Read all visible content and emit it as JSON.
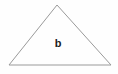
{
  "figure": {
    "type": "geometry-diagram",
    "shape_name": "triangle",
    "background_color": "#fefefe",
    "stroke_color": "#9a9a9a",
    "stroke_width": 1,
    "canvas": {
      "width": 118,
      "height": 74
    },
    "vertices": [
      {
        "name": "apex",
        "x": 57,
        "y": 5
      },
      {
        "name": "bottom-right",
        "x": 111,
        "y": 65
      },
      {
        "name": "bottom-left",
        "x": 9,
        "y": 65
      }
    ],
    "polygon_points": "57,5 111,65 9,65",
    "labels": [
      {
        "name": "side-label-b",
        "text": "b",
        "x": 58,
        "y": 44,
        "color": "#1c1c1c",
        "font_size": 11,
        "font_weight": "bold"
      }
    ]
  }
}
